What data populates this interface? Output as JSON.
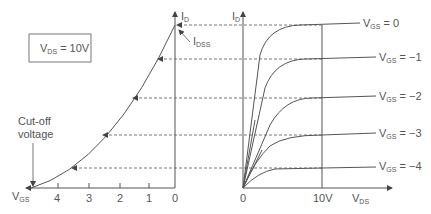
{
  "box_label": {
    "main": "V",
    "sub": "DS",
    "rest": " = 10V"
  },
  "left_plot": {
    "y_axis_label": {
      "main": "I",
      "sub": "D"
    },
    "idss_label": {
      "main": "I",
      "sub": "DSS"
    },
    "x_axis_label": {
      "main": "V",
      "sub": "GS"
    },
    "ticks": [
      "4",
      "3",
      "2",
      "1",
      "0"
    ],
    "cutoff_label_line1": "Cut-off",
    "cutoff_label_line2": "voltage"
  },
  "right_plot": {
    "y_axis_label": {
      "main": "I",
      "sub": "D"
    },
    "x_axis_label": {
      "main": "V",
      "sub": "DS"
    },
    "origin_label": "0",
    "x_tick_label": "10V",
    "curves": [
      {
        "main": "V",
        "sub": "GS",
        "rest": " = 0"
      },
      {
        "main": "V",
        "sub": "GS",
        "rest": " = −1"
      },
      {
        "main": "V",
        "sub": "GS",
        "rest": " = −2"
      },
      {
        "main": "V",
        "sub": "GS",
        "rest": " = −3"
      },
      {
        "main": "V",
        "sub": "GS",
        "rest": " = −4"
      }
    ]
  }
}
